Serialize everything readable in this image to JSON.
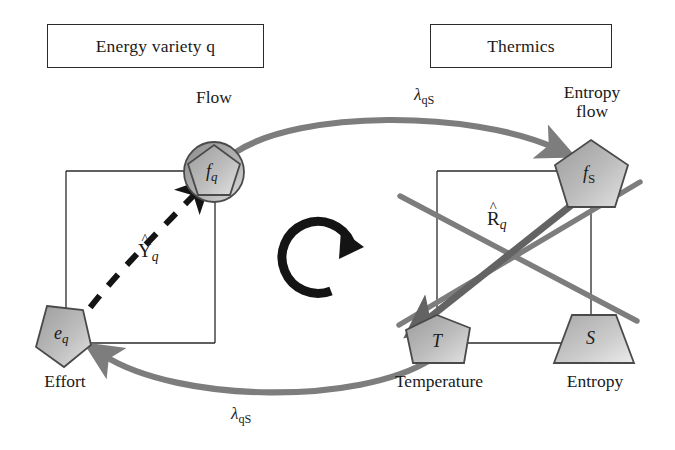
{
  "figure": {
    "type": "diagram",
    "subtype": "formal-graph / bond-graph style energy coupling diagram",
    "background_color": "#ffffff",
    "gray_arrow_color": "#7d7d7d",
    "dark_arrow_color": "#5a5a5a",
    "black_color": "#1a1a1a",
    "node_fill_light": "#d8d8d8",
    "node_fill_dark": "#9a9a9a",
    "node_stroke": "#4a4a4a"
  },
  "headers": [
    {
      "id": "energy-variety",
      "label": "Energy variety q"
    },
    {
      "id": "thermics",
      "label": "Thermics"
    }
  ],
  "nodes": [
    {
      "id": "fq",
      "symbol": "f",
      "subscript": "q",
      "caption": "Flow",
      "shape": "pentagon-in-circle",
      "caption_position": "above"
    },
    {
      "id": "eq",
      "symbol": "e",
      "subscript": "q",
      "caption": "Effort",
      "shape": "pentagon",
      "caption_position": "below"
    },
    {
      "id": "fS",
      "symbol": "f",
      "subscript": "S",
      "caption": "Entropy flow",
      "caption_lines": [
        "Entropy",
        "flow"
      ],
      "shape": "pentagon",
      "caption_position": "above"
    },
    {
      "id": "T",
      "symbol": "T",
      "subscript": "",
      "caption": "Temperature",
      "shape": "pentagon",
      "caption_position": "below"
    },
    {
      "id": "S",
      "symbol": "S",
      "subscript": "",
      "caption": "Entropy",
      "shape": "trapezoid",
      "caption_position": "below"
    }
  ],
  "edge_labels": [
    {
      "id": "lambda-top",
      "base": "λ",
      "subscript": "qS",
      "meaning": "coupling from flow to entropy flow"
    },
    {
      "id": "lambda-bottom",
      "base": "λ",
      "subscript": "qS",
      "meaning": "coupling from temperature to effort"
    },
    {
      "id": "Y-hat-q",
      "base": "Y",
      "hat": "^",
      "subscript": "q",
      "meaning": "capacitance operator, dashed black arrow e_q to f_q"
    },
    {
      "id": "R-hat-q",
      "base": "R",
      "hat": "^",
      "subscript": "q",
      "meaning": "resistance operator, thick arrow f_S to T"
    }
  ],
  "center_glyph": {
    "id": "cycle-arrow",
    "name": "clockwise-circular-arrow",
    "direction": "clockwise"
  }
}
